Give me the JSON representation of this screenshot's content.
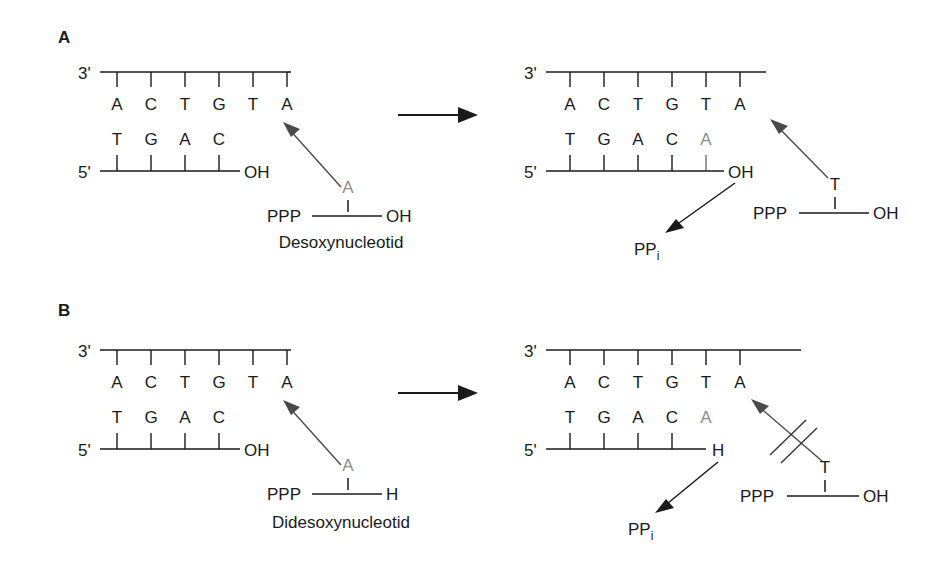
{
  "figure": {
    "background_color": "#ffffff",
    "ink_color": "#1a1a1a",
    "new_base_color": "#8d8d8d"
  },
  "panels": [
    {
      "id": "A",
      "label": "A",
      "caption": "Desoxynucleotid",
      "left": {
        "three_prime_label": "3'",
        "five_prime_label": "5'",
        "template_bases": [
          "A",
          "C",
          "T",
          "G",
          "T",
          "A"
        ],
        "primer_bases": [
          "T",
          "G",
          "A",
          "C"
        ],
        "primer_terminus": "OH",
        "incoming_base": "A",
        "incoming_left_group": "PPP",
        "incoming_right_group": "OH"
      },
      "right": {
        "three_prime_label": "3'",
        "five_prime_label": "5'",
        "template_bases": [
          "A",
          "C",
          "T",
          "G",
          "T",
          "A"
        ],
        "primer_bases": [
          "T",
          "G",
          "A",
          "C"
        ],
        "added_base": "A",
        "primer_terminus": "OH",
        "byproduct": "PP",
        "byproduct_subscript": "i",
        "incoming_base": "T",
        "incoming_left_group": "PPP",
        "incoming_right_group": "OH",
        "reaction_blocked": false
      }
    },
    {
      "id": "B",
      "label": "B",
      "caption": "Didesoxynucleotid",
      "left": {
        "three_prime_label": "3'",
        "five_prime_label": "5'",
        "template_bases": [
          "A",
          "C",
          "T",
          "G",
          "T",
          "A"
        ],
        "primer_bases": [
          "T",
          "G",
          "A",
          "C"
        ],
        "primer_terminus": "OH",
        "incoming_base": "A",
        "incoming_left_group": "PPP",
        "incoming_right_group": "H"
      },
      "right": {
        "three_prime_label": "3'",
        "five_prime_label": "5'",
        "template_bases": [
          "A",
          "C",
          "T",
          "G",
          "T",
          "A"
        ],
        "primer_bases": [
          "T",
          "G",
          "A",
          "C"
        ],
        "added_base": "A",
        "primer_terminus": "H",
        "byproduct": "PP",
        "byproduct_subscript": "i",
        "incoming_base": "T",
        "incoming_left_group": "PPP",
        "incoming_right_group": "OH",
        "reaction_blocked": true
      }
    }
  ]
}
